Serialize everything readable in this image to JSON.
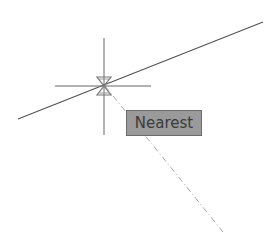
{
  "tooltip": {
    "label": "Nearest"
  },
  "snap_mode": "nearest",
  "colors": {
    "line": "#555555",
    "crosshair": "#666666",
    "tooltip_bg": "#9a9a9a",
    "tracking_line": "#aaaaaa"
  }
}
